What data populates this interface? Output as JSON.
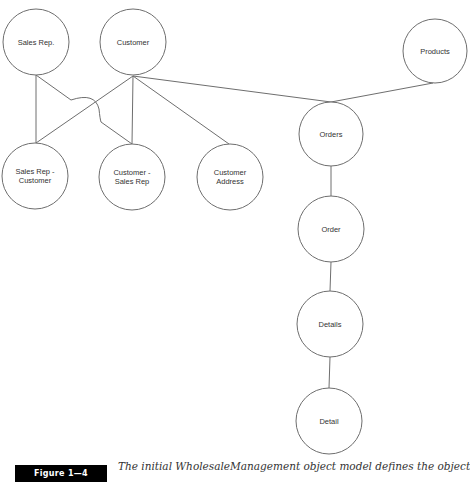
{
  "diagram": {
    "title": "WholesaleManagement object model",
    "nodes": [
      {
        "id": "sales_rep",
        "label_lines": [
          "Sales Rep."
        ],
        "cx": 36,
        "cy": 42,
        "r": 33
      },
      {
        "id": "customer",
        "label_lines": [
          "Customer"
        ],
        "cx": 133,
        "cy": 42,
        "r": 33
      },
      {
        "id": "products",
        "label_lines": [
          "Products"
        ],
        "cx": 435,
        "cy": 51,
        "r": 32
      },
      {
        "id": "sales_rep_customer",
        "label_lines": [
          "Sales Rep -",
          "Customer"
        ],
        "cx": 35,
        "cy": 176,
        "r": 33
      },
      {
        "id": "customer_sales_rep",
        "label_lines": [
          "Customer -",
          "Sales Rep"
        ],
        "cx": 132,
        "cy": 177,
        "r": 33
      },
      {
        "id": "customer_address",
        "label_lines": [
          "Customer",
          "Address"
        ],
        "cx": 230,
        "cy": 177,
        "r": 33
      },
      {
        "id": "orders",
        "label_lines": [
          "Orders"
        ],
        "cx": 331,
        "cy": 134,
        "r": 32
      },
      {
        "id": "order",
        "label_lines": [
          "Order"
        ],
        "cx": 331,
        "cy": 229,
        "r": 33
      },
      {
        "id": "details",
        "label_lines": [
          "Details"
        ],
        "cx": 330,
        "cy": 324,
        "r": 33
      },
      {
        "id": "detail",
        "label_lines": [
          "Detail"
        ],
        "cx": 329,
        "cy": 421,
        "r": 33
      }
    ],
    "edges": [
      {
        "from": "sales_rep",
        "to": "sales_rep_customer"
      },
      {
        "from": "sales_rep",
        "to": "customer_sales_rep",
        "style": "jump-over"
      },
      {
        "from": "customer",
        "to": "sales_rep_customer"
      },
      {
        "from": "customer",
        "to": "customer_sales_rep"
      },
      {
        "from": "customer",
        "to": "customer_address"
      },
      {
        "from": "customer",
        "to": "orders"
      },
      {
        "from": "products",
        "to": "orders"
      },
      {
        "from": "orders",
        "to": "order"
      },
      {
        "from": "order",
        "to": "details"
      },
      {
        "from": "details",
        "to": "detail"
      }
    ]
  },
  "figure": {
    "tag": "Figure 1—4",
    "caption": "The initial WholesaleManagement object model defines the objects"
  }
}
